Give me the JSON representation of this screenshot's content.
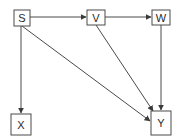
{
  "diagram": {
    "type": "directed-acyclic-graph",
    "colors": {
      "stroke": "#4a4a4a",
      "node_fill": "#ffffff",
      "text": "#2a2a2a"
    },
    "nodes": [
      {
        "id": "S",
        "label": "S"
      },
      {
        "id": "V",
        "label": "V"
      },
      {
        "id": "W",
        "label": "W"
      },
      {
        "id": "X",
        "label": "X"
      },
      {
        "id": "Y",
        "label": "Y"
      }
    ],
    "edges": [
      {
        "from": "S",
        "to": "V"
      },
      {
        "from": "V",
        "to": "W"
      },
      {
        "from": "S",
        "to": "X"
      },
      {
        "from": "S",
        "to": "Y"
      },
      {
        "from": "V",
        "to": "Y"
      },
      {
        "from": "W",
        "to": "Y"
      }
    ]
  }
}
